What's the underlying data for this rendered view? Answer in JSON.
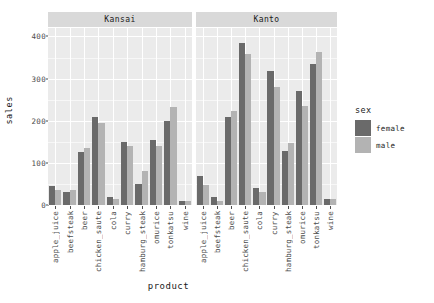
{
  "chart_data": {
    "type": "bar",
    "title": "",
    "xlabel": "product",
    "ylabel": "sales",
    "ylim": [
      0,
      420
    ],
    "yticks": [
      0,
      100,
      200,
      300,
      400
    ],
    "grid": true,
    "legend": {
      "title": "sex",
      "position": "right",
      "entries": [
        {
          "name": "female",
          "color": "#6a6a6a"
        },
        {
          "name": "male",
          "color": "#b3b3b3"
        }
      ]
    },
    "facet_variable": "area",
    "facets": [
      "Kansai",
      "Kanto"
    ],
    "categories": [
      "apple_juice",
      "beefsteak",
      "beer",
      "chicken_saute",
      "cola",
      "curry",
      "hamburg_steak",
      "omurice",
      "tonkatsu",
      "wine"
    ],
    "panels": [
      {
        "facet": "Kansai",
        "series": [
          {
            "name": "female",
            "values": [
              45,
              32,
              125,
              210,
              20,
              150,
              50,
              155,
              200,
              10
            ]
          },
          {
            "name": "male",
            "values": [
              35,
              35,
              135,
              195,
              15,
              140,
              80,
              140,
              232,
              10
            ]
          }
        ]
      },
      {
        "facet": "Kanto",
        "series": [
          {
            "name": "female",
            "values": [
              68,
              18,
              210,
              385,
              40,
              318,
              128,
              270,
              335,
              15
            ]
          },
          {
            "name": "male",
            "values": [
              48,
              10,
              222,
              358,
              30,
              280,
              148,
              235,
              362,
              15
            ]
          }
        ]
      }
    ]
  },
  "colors": {
    "panel_bg": "#ebebeb",
    "strip_bg": "#d9d9d9",
    "grid_major": "#ffffff",
    "grid_minor": "#f7f7f7",
    "female": "#6a6a6a",
    "male": "#b3b3b3",
    "text": "#1a1a1a",
    "axis_text": "#4d4d4d"
  }
}
